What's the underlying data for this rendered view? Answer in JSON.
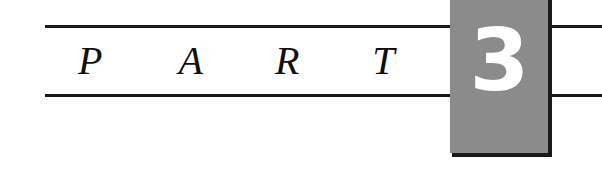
{
  "page": {
    "kind": "book-part-divider",
    "background_color": "#ffffff"
  },
  "divider": {
    "part_label": "PART",
    "letters": [
      "P",
      "A",
      "R",
      "T"
    ],
    "number": "3",
    "rules": {
      "color": "#1a1a1a",
      "count": 4,
      "description": "two horizontal rules broken by the number block"
    },
    "number_block": {
      "fill_color": "#8b8b8b",
      "edge_color": "#1a1a1a",
      "number_color": "#ffffff"
    }
  }
}
